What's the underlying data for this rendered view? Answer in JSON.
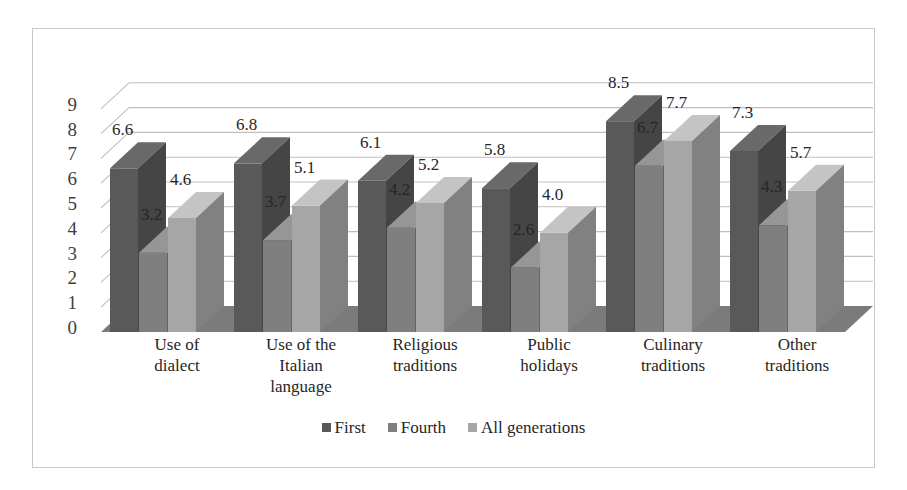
{
  "chart_data": {
    "type": "bar",
    "title": "",
    "xlabel": "",
    "ylabel": "",
    "ylim": [
      0,
      9
    ],
    "yticks": [
      0,
      1,
      2,
      3,
      4,
      5,
      6,
      7,
      8,
      9
    ],
    "grid": true,
    "legend_position": "bottom",
    "style": "3d-clustered-column",
    "categories": [
      "Use of dialect",
      "Use of the Italian language",
      "Religious traditions",
      "Public holidays",
      "Culinary traditions",
      "Other traditions"
    ],
    "category_label_lines": [
      [
        "Use of",
        "dialect"
      ],
      [
        "Use of the",
        "Italian",
        "language"
      ],
      [
        "Religious",
        "traditions"
      ],
      [
        "Public",
        "holidays"
      ],
      [
        "Culinary",
        "traditions"
      ],
      [
        "Other",
        "traditions"
      ]
    ],
    "series": [
      {
        "name": "First",
        "color": "#595959",
        "values": [
          6.6,
          6.8,
          6.1,
          5.8,
          8.5,
          7.3
        ],
        "labels": [
          "6.6",
          "6.8",
          "6.1",
          "5.8",
          "8.5",
          "7.3"
        ]
      },
      {
        "name": "Fourth",
        "color": "#7f7f7f",
        "values": [
          3.2,
          3.7,
          4.2,
          2.6,
          6.7,
          4.3
        ],
        "labels": [
          "3.2",
          "3.7",
          "4.2",
          "2.6",
          "6.7",
          "4.3"
        ]
      },
      {
        "name": "All generations",
        "color": "#a6a6a6",
        "values": [
          4.6,
          5.1,
          5.2,
          4.0,
          7.7,
          5.7
        ],
        "labels": [
          "4.6",
          "5.1",
          "5.2",
          "4.0",
          "7.7",
          "5.7"
        ]
      }
    ]
  },
  "legend": {
    "items": [
      {
        "label": "First",
        "color": "#595959"
      },
      {
        "label": "Fourth",
        "color": "#7f7f7f"
      },
      {
        "label": "All generations",
        "color": "#a6a6a6"
      }
    ]
  },
  "colors": {
    "frame_border": "#c9c9c9",
    "gridline": "#bfbfbf",
    "floor": "#7b7b7b",
    "axis_text": "#404040",
    "label_text": "#262626",
    "background": "#ffffff"
  }
}
